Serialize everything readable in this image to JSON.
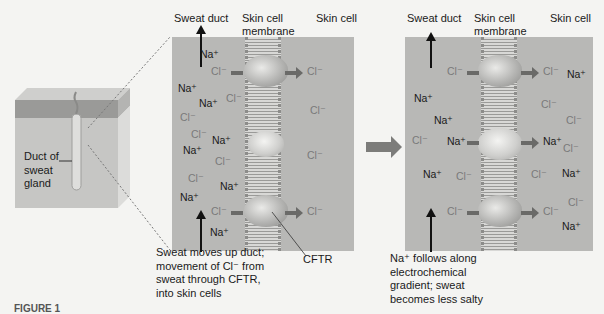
{
  "figure": {
    "caption_partial": "FIGURE 1",
    "transition_arrow": "right-arrow"
  },
  "block": {
    "label": [
      "Duct of",
      "sweat",
      "gland"
    ]
  },
  "panel_left": {
    "headers": {
      "sweat_duct": "Sweat duct",
      "membrane_line1": "Skin cell",
      "membrane_line2": "membrane",
      "skin_cell": "Skin cell"
    },
    "ions_duct": [
      {
        "text": "Na⁺",
        "type": "na",
        "x": 200,
        "y": 48
      },
      {
        "text": "Na⁺",
        "type": "na",
        "x": 178,
        "y": 82
      },
      {
        "text": "Cl⁻",
        "type": "cl",
        "x": 226,
        "y": 92
      },
      {
        "text": "Na⁺",
        "type": "na",
        "x": 199,
        "y": 97
      },
      {
        "text": "Cl⁻",
        "type": "cl",
        "x": 180,
        "y": 111
      },
      {
        "text": "Cl⁻",
        "type": "cl",
        "x": 191,
        "y": 128
      },
      {
        "text": "Na⁺",
        "type": "na",
        "x": 212,
        "y": 134
      },
      {
        "text": "Na⁺",
        "type": "na",
        "x": 183,
        "y": 144
      },
      {
        "text": "Cl⁻",
        "type": "cl",
        "x": 215,
        "y": 155
      },
      {
        "text": "Cl⁻",
        "type": "cl",
        "x": 188,
        "y": 172
      },
      {
        "text": "Na⁺",
        "type": "na",
        "x": 220,
        "y": 180
      },
      {
        "text": "Na⁺",
        "type": "na",
        "x": 180,
        "y": 191
      },
      {
        "text": "Na⁺",
        "type": "na",
        "x": 210,
        "y": 226
      }
    ],
    "ions_cell": [
      {
        "text": "Cl⁻",
        "type": "cl",
        "x": 310,
        "y": 104
      },
      {
        "text": "Cl⁻",
        "type": "cl",
        "x": 307,
        "y": 149
      }
    ],
    "channel_flows": [
      {
        "in": "Cl⁻",
        "out": "Cl⁻",
        "y": 71
      },
      {
        "in": "Cl⁻",
        "out": "Cl⁻",
        "y": 211
      }
    ],
    "cftr_label": "CFTR",
    "caption": [
      "Sweat moves up duct;",
      "movement of Cl⁻ from",
      "sweat through CFTR,",
      "into skin cells"
    ]
  },
  "panel_right": {
    "headers": {
      "sweat_duct": "Sweat duct",
      "membrane_line1": "Skin cell",
      "membrane_line2": "membrane",
      "skin_cell": "Skin cell"
    },
    "ions_duct": [
      {
        "text": "Na⁺",
        "type": "na",
        "x": 414,
        "y": 92
      },
      {
        "text": "Na⁺",
        "type": "na",
        "x": 434,
        "y": 114
      },
      {
        "text": "Cl⁻",
        "type": "cl",
        "x": 412,
        "y": 134
      },
      {
        "text": "Na⁺",
        "type": "na",
        "x": 423,
        "y": 168
      },
      {
        "text": "Cl⁻",
        "type": "cl",
        "x": 456,
        "y": 170
      }
    ],
    "ions_cell": [
      {
        "text": "Na⁺",
        "type": "na",
        "x": 567,
        "y": 68
      },
      {
        "text": "Cl⁻",
        "type": "cl",
        "x": 541,
        "y": 98
      },
      {
        "text": "Cl⁻",
        "type": "cl",
        "x": 566,
        "y": 114
      },
      {
        "text": "Cl⁻",
        "type": "cl",
        "x": 563,
        "y": 142
      },
      {
        "text": "Cl⁻",
        "type": "cl",
        "x": 531,
        "y": 168
      },
      {
        "text": "Na⁺",
        "type": "na",
        "x": 562,
        "y": 167
      },
      {
        "text": "Cl⁻",
        "type": "cl",
        "x": 568,
        "y": 196
      },
      {
        "text": "Na⁺",
        "type": "na",
        "x": 562,
        "y": 220
      }
    ],
    "channel_flows": [
      {
        "in": "Cl⁻",
        "out": "Cl⁻",
        "y": 71
      },
      {
        "in": "Na⁺",
        "out": "Na⁺",
        "y": 141
      },
      {
        "in": "Cl⁻",
        "out": "Cl⁻",
        "y": 211
      }
    ],
    "caption": [
      "Na⁺ follows along",
      "electrochemical",
      "gradient; sweat",
      "becomes less salty"
    ]
  }
}
